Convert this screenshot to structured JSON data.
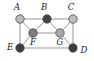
{
  "figure": {
    "kind": "graph-diagram",
    "width": 94,
    "height": 61,
    "background_color": "#ffffff",
    "edge_color": "#8c8c8c",
    "node_stroke_color": "#4a4a4a",
    "label_color": "#1a1a1a"
  },
  "nodes": [
    {
      "id": "A",
      "label": "A",
      "cx": 20,
      "cy": 19,
      "r": 4.2,
      "fill": "#b9b9b9",
      "label_x": 17,
      "label_y": 7
    },
    {
      "id": "B",
      "label": "B",
      "cx": 47,
      "cy": 19,
      "r": 4.2,
      "fill": "#454545",
      "label_x": 44,
      "label_y": 7
    },
    {
      "id": "C",
      "label": "C",
      "cx": 73,
      "cy": 19,
      "r": 4.2,
      "fill": "#bdbdbd",
      "label_x": 71,
      "label_y": 7
    },
    {
      "id": "F",
      "label": "F",
      "cx": 33,
      "cy": 33,
      "r": 4.2,
      "fill": "#7c7c7c",
      "label_x": 33,
      "label_y": 42
    },
    {
      "id": "G",
      "label": "G",
      "cx": 60,
      "cy": 33,
      "r": 4.2,
      "fill": "#a9a9a9",
      "label_x": 60,
      "label_y": 42
    },
    {
      "id": "E",
      "label": "E",
      "cx": 20,
      "cy": 48,
      "r": 4.2,
      "fill": "#3d3d3d",
      "label_x": 10,
      "label_y": 47
    },
    {
      "id": "D",
      "label": "D",
      "cx": 73,
      "cy": 48,
      "r": 4.2,
      "fill": "#3d3d3d",
      "label_x": 84,
      "label_y": 50
    }
  ],
  "edges": [
    {
      "from": "A",
      "to": "B"
    },
    {
      "from": "B",
      "to": "C"
    },
    {
      "from": "A",
      "to": "E"
    },
    {
      "from": "C",
      "to": "D"
    },
    {
      "from": "E",
      "to": "D"
    },
    {
      "from": "A",
      "to": "F"
    },
    {
      "from": "B",
      "to": "F"
    },
    {
      "from": "B",
      "to": "G"
    },
    {
      "from": "C",
      "to": "G"
    },
    {
      "from": "F",
      "to": "G"
    },
    {
      "from": "E",
      "to": "F"
    },
    {
      "from": "G",
      "to": "D"
    }
  ]
}
